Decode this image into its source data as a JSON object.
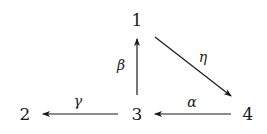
{
  "diagram": {
    "type": "directed-graph",
    "nodes": [
      {
        "id": "1",
        "label": "1",
        "x": 137,
        "y": 26
      },
      {
        "id": "2",
        "label": "2",
        "x": 25,
        "y": 120
      },
      {
        "id": "3",
        "label": "3",
        "x": 137,
        "y": 120
      },
      {
        "id": "4",
        "label": "4",
        "x": 248,
        "y": 120
      }
    ],
    "edges": [
      {
        "from": "3",
        "to": "1",
        "label": "β"
      },
      {
        "from": "1",
        "to": "4",
        "label": "η"
      },
      {
        "from": "3",
        "to": "2",
        "label": "γ"
      },
      {
        "from": "4",
        "to": "3",
        "label": "α"
      }
    ]
  }
}
